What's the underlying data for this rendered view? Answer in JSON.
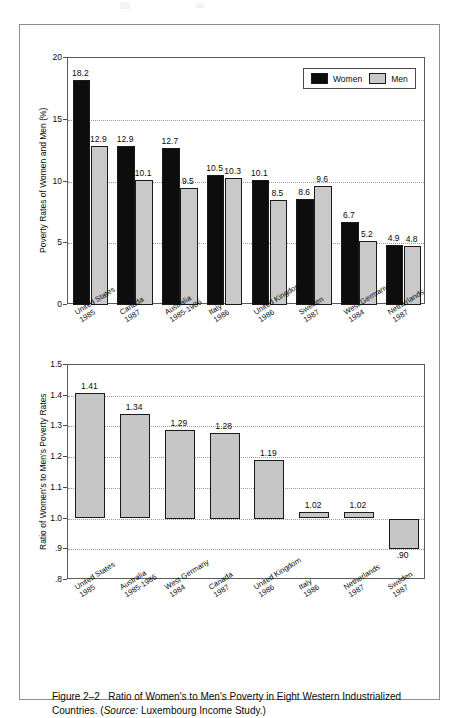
{
  "figure": {
    "caption_prefix": "Figure 2–2",
    "caption_main": "Ratio of Women's to Men's Poverty in Eight Western Industrialized Countries. (",
    "caption_source_label": "Source:",
    "caption_source_value": " Luxembourg Income Study.)"
  },
  "colors": {
    "women_bar": "#0d0d0d",
    "men_bar": "#c9c9c9",
    "ratio_bar": "#c6c6c6",
    "grid": "#9a9a9a",
    "axis": "#5a5a5a",
    "frame": "#8d8d8d"
  },
  "chart_data": [
    {
      "type": "bar",
      "id": "poverty-rates",
      "title": "",
      "xlabel": "",
      "ylabel": "Poverty Rates of Women and Men (%)",
      "ylim": [
        0,
        20
      ],
      "yticks": [
        "0",
        "5",
        "10",
        "15",
        "20"
      ],
      "ytick_values": [
        0,
        5,
        10,
        15,
        20
      ],
      "grid": true,
      "legend": [
        "Women",
        "Men"
      ],
      "legend_position": "top-right",
      "categories": [
        {
          "country": "United States",
          "year": "1985"
        },
        {
          "country": "Canada",
          "year": "1987"
        },
        {
          "country": "Australia",
          "year": "1985-1986"
        },
        {
          "country": "Italy",
          "year": "1986"
        },
        {
          "country": "United Kingdom",
          "year": "1986"
        },
        {
          "country": "Sweden",
          "year": "1987"
        },
        {
          "country": "West Germany",
          "year": "1984"
        },
        {
          "country": "Netherlands",
          "year": "1987"
        }
      ],
      "series": [
        {
          "name": "Women",
          "values": [
            18.2,
            12.9,
            12.7,
            10.5,
            10.1,
            8.6,
            6.7,
            4.9
          ],
          "labels": [
            "18.2",
            "12.9",
            "12.7",
            "10.5",
            "10.1",
            "8.6",
            "6.7",
            "4.9"
          ]
        },
        {
          "name": "Men",
          "values": [
            12.9,
            10.1,
            9.5,
            10.3,
            8.5,
            9.6,
            5.2,
            4.8
          ],
          "labels": [
            "12.9",
            "10.1",
            "9.5",
            "10.3",
            "8.5",
            "9.6",
            "5.2",
            "4.8"
          ]
        }
      ]
    },
    {
      "type": "bar",
      "id": "poverty-ratio",
      "title": "",
      "xlabel": "",
      "ylabel": "Ratio of Women's to Men's Poverty Rates",
      "ylim": [
        0.8,
        1.5
      ],
      "baseline": 1.0,
      "yticks": [
        ".8",
        ".9",
        "1.0",
        "1.1",
        "1.2",
        "1.3",
        "1.4",
        "1.5"
      ],
      "ytick_values": [
        0.8,
        0.9,
        1.0,
        1.1,
        1.2,
        1.3,
        1.4,
        1.5
      ],
      "grid": true,
      "categories": [
        {
          "country": "United States",
          "year": "1985"
        },
        {
          "country": "Australia",
          "year": "1985-1986"
        },
        {
          "country": "West Germany",
          "year": "1984"
        },
        {
          "country": "Canada",
          "year": "1987"
        },
        {
          "country": "United Kingdom",
          "year": "1986"
        },
        {
          "country": "Italy",
          "year": "1986"
        },
        {
          "country": "Netherlands",
          "year": "1987"
        },
        {
          "country": "Sweden",
          "year": "1987"
        }
      ],
      "values": [
        1.41,
        1.34,
        1.29,
        1.28,
        1.19,
        1.02,
        1.02,
        0.9
      ],
      "labels": [
        "1.41",
        "1.34",
        "1.29",
        "1.28",
        "1.19",
        "1.02",
        "1.02",
        ".90"
      ]
    }
  ]
}
